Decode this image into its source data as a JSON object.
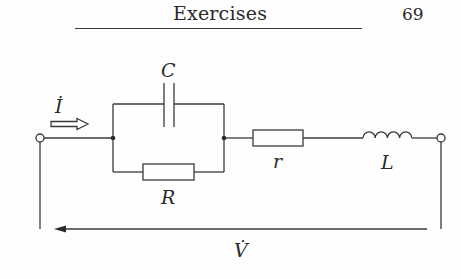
{
  "header": {
    "title": "Exercises",
    "page_number": "69"
  },
  "circuit": {
    "labels": {
      "current": "İ",
      "capacitor": "C",
      "resistor_parallel": "R",
      "resistor_series": "r",
      "inductor": "L",
      "voltage": "V̇"
    },
    "components": [
      {
        "type": "terminal",
        "id": "left-terminal"
      },
      {
        "type": "capacitor",
        "label": "C",
        "branch": "parallel-top"
      },
      {
        "type": "resistor",
        "label": "R",
        "branch": "parallel-bottom"
      },
      {
        "type": "resistor",
        "label": "r",
        "branch": "series"
      },
      {
        "type": "inductor",
        "label": "L",
        "branch": "series"
      },
      {
        "type": "terminal",
        "id": "right-terminal"
      }
    ],
    "colors": {
      "line": "#3a3a3a",
      "text": "#2a2a2a"
    }
  }
}
